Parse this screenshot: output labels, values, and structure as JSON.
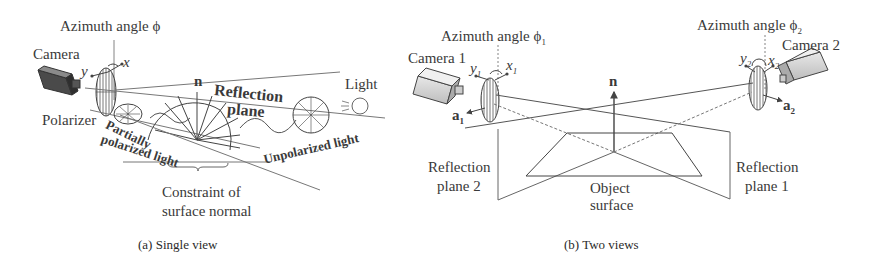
{
  "panel_a": {
    "caption": "(a) Single view",
    "labels": {
      "azimuth": "Azimuth angle",
      "azimuth_symbol": "ϕ",
      "camera": "Camera",
      "axis_x": "x",
      "axis_y": "y",
      "polarizer": "Polarizer",
      "partially": "Partially",
      "polarized_light": "polarized light",
      "normal": "n",
      "reflection": "Reflection",
      "plane": "plane",
      "light": "Light",
      "unpolarized_light": "Unpolarized light",
      "constraint_line1": "Constraint of",
      "constraint_line2": "surface normal"
    }
  },
  "panel_b": {
    "caption": "(b) Two views",
    "labels": {
      "azimuth1": "Azimuth angle",
      "azimuth1_symbol": "ϕ",
      "azimuth1_sub": "1",
      "azimuth2": "Azimuth angle",
      "azimuth2_symbol": "ϕ",
      "azimuth2_sub": "2",
      "camera1": "Camera 1",
      "camera2": "Camera 2",
      "y1": "y",
      "y1_sub": "1",
      "x1": "x",
      "x1_sub": "1",
      "y2": "y",
      "y2_sub": "2",
      "x2": "x",
      "x2_sub": "2",
      "a1": "a",
      "a1_sub": "1",
      "a2": "a",
      "a2_sub": "2",
      "normal": "n",
      "reflection_plane2_line1": "Reflection",
      "reflection_plane2_line2": "plane 2",
      "reflection_plane1_line1": "Reflection",
      "reflection_plane1_line2": "plane 1",
      "object_line1": "Object",
      "object_line2": "surface"
    }
  }
}
